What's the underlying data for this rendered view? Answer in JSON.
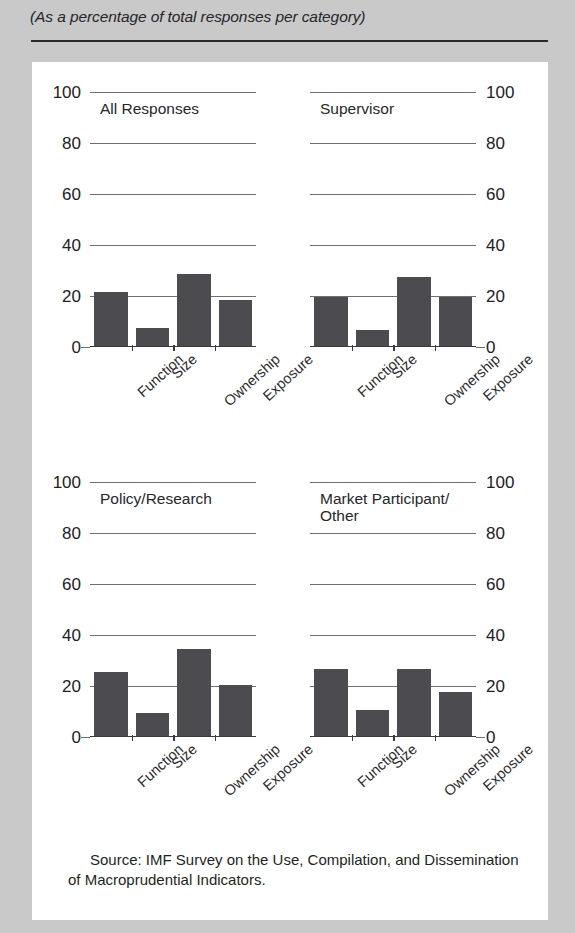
{
  "header": {
    "subtitle": "(As a percentage of total responses per category)"
  },
  "source": {
    "text": "Source: IMF Survey on the Use, Compilation, and Dissemination of Macroprudential Indicators."
  },
  "axis": {
    "yticks": [
      "100",
      "80",
      "60",
      "40",
      "20",
      "0"
    ],
    "ytick_values": [
      100,
      80,
      60,
      40,
      20,
      0
    ]
  },
  "chart_data": [
    {
      "type": "bar",
      "title": "All Responses",
      "categories": [
        "Function",
        "Size",
        "Ownership",
        "Exposure"
      ],
      "values": [
        21,
        7,
        28,
        18
      ],
      "xlabel": "",
      "ylabel": "",
      "ylim": [
        0,
        100
      ],
      "grid": true,
      "legend": "none",
      "ytick_side": "left"
    },
    {
      "type": "bar",
      "title": "Supervisor",
      "categories": [
        "Function",
        "Size",
        "Ownership",
        "Exposure"
      ],
      "values": [
        19,
        6,
        27,
        19
      ],
      "xlabel": "",
      "ylabel": "",
      "ylim": [
        0,
        100
      ],
      "grid": true,
      "legend": "none",
      "ytick_side": "right"
    },
    {
      "type": "bar",
      "title": "Policy/Research",
      "categories": [
        "Function",
        "Size",
        "Ownership",
        "Exposure"
      ],
      "values": [
        25,
        9,
        34,
        20
      ],
      "xlabel": "",
      "ylabel": "",
      "ylim": [
        0,
        100
      ],
      "grid": true,
      "legend": "none",
      "ytick_side": "left"
    },
    {
      "type": "bar",
      "title": "Market Participant/\nOther",
      "categories": [
        "Function",
        "Size",
        "Ownership",
        "Exposure"
      ],
      "values": [
        26,
        10,
        26,
        17
      ],
      "xlabel": "",
      "ylabel": "",
      "ylim": [
        0,
        100
      ],
      "grid": true,
      "legend": "none",
      "ytick_side": "right"
    }
  ],
  "colors": {
    "bar": "#4c4c50",
    "gridline": "#6f6f75",
    "axis": "#3a3a3e",
    "page_background": "#c9c9c9",
    "card_background": "#ffffff",
    "text": "#222226"
  }
}
